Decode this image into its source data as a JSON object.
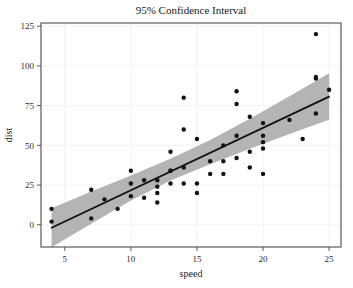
{
  "figure": {
    "title": "95% Confidence Interval",
    "background_color": "#ffffff"
  },
  "axes": {
    "x": {
      "label": "speed",
      "ticks": [
        "5",
        "10",
        "15",
        "20",
        "25"
      ],
      "tick_values": [
        5,
        10,
        15,
        20,
        25
      ],
      "range": [
        3.2,
        25.9
      ]
    },
    "y": {
      "label": "dist",
      "ticks": [
        "0",
        "25",
        "50",
        "75",
        "100",
        "125"
      ],
      "tick_values": [
        0,
        25,
        50,
        75,
        100,
        125
      ],
      "range": [
        -14,
        127
      ]
    }
  },
  "style": {
    "point_color": "#111111",
    "line_color": "#111111",
    "band_color": "#b4b4b4",
    "grid_color": "#f2f2f2",
    "frame_color": "#5a5a5a"
  },
  "chart_data": {
    "type": "scatter",
    "title": "95% Confidence Interval",
    "xlabel": "speed",
    "ylabel": "dist",
    "xlim": [
      3.2,
      25.9
    ],
    "ylim": [
      -14,
      127
    ],
    "grid": true,
    "legend": null,
    "series": [
      {
        "name": "observations",
        "type": "scatter",
        "marker": "filled-circle",
        "color": "#111111",
        "x": [
          4,
          4,
          7,
          7,
          8,
          9,
          10,
          10,
          10,
          11,
          11,
          12,
          12,
          12,
          12,
          13,
          13,
          13,
          13,
          14,
          14,
          14,
          14,
          15,
          15,
          15,
          16,
          16,
          17,
          17,
          17,
          18,
          18,
          18,
          18,
          19,
          19,
          19,
          20,
          20,
          20,
          20,
          20,
          22,
          23,
          24,
          24,
          24,
          24,
          25
        ],
        "y": [
          2,
          10,
          4,
          22,
          16,
          10,
          18,
          26,
          34,
          17,
          28,
          14,
          20,
          24,
          28,
          26,
          34,
          34,
          46,
          26,
          36,
          60,
          80,
          20,
          26,
          54,
          32,
          40,
          32,
          40,
          50,
          42,
          56,
          76,
          84,
          36,
          46,
          68,
          32,
          48,
          52,
          56,
          64,
          66,
          54,
          70,
          92,
          93,
          120,
          85
        ]
      },
      {
        "name": "regression-line",
        "type": "line",
        "color": "#111111",
        "intercept": -17.58,
        "slope": 3.93,
        "x": [
          4,
          25
        ],
        "y": [
          -1.86,
          80.67
        ]
      },
      {
        "name": "confidence-band-95",
        "type": "area",
        "color": "#b4b4b4",
        "x": [
          4,
          7,
          10,
          13,
          16,
          19,
          22,
          25
        ],
        "y_lower": [
          -14.1,
          0.7,
          15.2,
          27.8,
          38.1,
          47.9,
          57.2,
          66.1
        ],
        "y_upper": [
          10.4,
          20.9,
          31.0,
          41.6,
          53.4,
          66.7,
          80.9,
          95.3
        ]
      }
    ]
  }
}
